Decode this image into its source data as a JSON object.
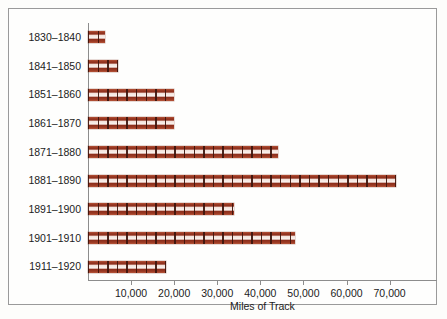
{
  "chart_data": {
    "type": "bar",
    "orientation": "horizontal",
    "title": "",
    "xlabel": "Miles of Track",
    "ylabel": "",
    "categories": [
      "1830–1840",
      "1841–1850",
      "1851–1860",
      "1861–1870",
      "1871–1880",
      "1881–1890",
      "1891–1900",
      "1901–1910",
      "1911–1920"
    ],
    "values": [
      4000,
      7000,
      20000,
      20000,
      44000,
      71500,
      34000,
      48000,
      18000
    ],
    "xlim": [
      0,
      81000
    ],
    "xticks": [
      10000,
      20000,
      30000,
      40000,
      50000,
      60000,
      70000
    ],
    "xtick_labels": [
      "10,000",
      "20,000",
      "30,000",
      "40,000",
      "50,000",
      "60,000",
      "70,000"
    ],
    "grid": false,
    "legend": null,
    "bar_style": "railroad-track",
    "colors": {
      "bar_rail": "#8e2f1c",
      "bar_highlight": "#b8563a",
      "bar_ballast": "#faf2ee",
      "axis": "#8d8d8d",
      "text": "#1c1c1c",
      "frame_border": "#9a9a9a",
      "background": "#fefefd"
    }
  }
}
